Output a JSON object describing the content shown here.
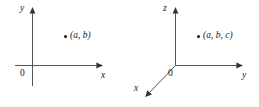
{
  "figure": {
    "background_color": "#ffffff",
    "line_color": "#555555",
    "text_color": "#1a1a1a",
    "dot_color": "#111111"
  },
  "diagram_2d": {
    "name": "two-dimensional-cartesian-coordinate-system",
    "origin_label": "0",
    "axes": [
      {
        "name": "y-axis",
        "label": "y",
        "orientation": "vertical",
        "arrow": "up"
      },
      {
        "name": "x-axis",
        "label": "x",
        "orientation": "horizontal",
        "arrow": "right"
      }
    ],
    "x_axis_label": "x",
    "y_axis_label": "y",
    "point": {
      "label": "(a, b)",
      "coordinates": [
        "a",
        "b"
      ],
      "marker": "filled-circle"
    }
  },
  "diagram_3d": {
    "name": "three-dimensional-cartesian-coordinate-system",
    "origin_label": "0",
    "axes": [
      {
        "name": "z-axis",
        "label": "z",
        "orientation": "vertical",
        "arrow": "up"
      },
      {
        "name": "y-axis",
        "label": "y",
        "orientation": "horizontal",
        "arrow": "right"
      },
      {
        "name": "x-axis",
        "label": "x",
        "orientation": "diagonal",
        "arrow": "down-left"
      }
    ],
    "x_axis_label": "x",
    "y_axis_label": "y",
    "z_axis_label": "z",
    "point": {
      "label": "(a, b, c)",
      "coordinates": [
        "a",
        "b",
        "c"
      ],
      "marker": "filled-circle"
    }
  }
}
